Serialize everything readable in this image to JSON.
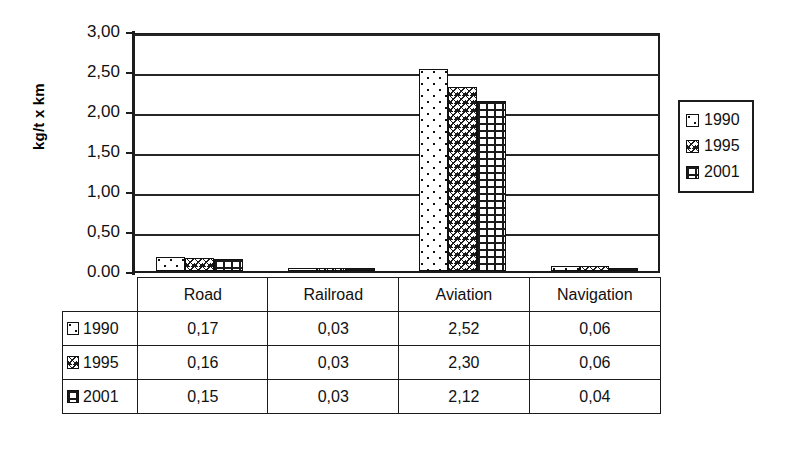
{
  "chart_data": {
    "type": "bar",
    "title": "",
    "subtitle": "",
    "xlabel": "",
    "ylabel": "kg/t x km",
    "categories": [
      "Road",
      "Railroad",
      "Aviation",
      "Navigation"
    ],
    "series": [
      {
        "name": "1990",
        "values": [
          0.17,
          0.03,
          2.52,
          0.06
        ],
        "pattern": "dots"
      },
      {
        "name": "1995",
        "values": [
          0.16,
          0.03,
          2.3,
          0.06
        ],
        "pattern": "zigzag"
      },
      {
        "name": "2001",
        "values": [
          0.15,
          0.03,
          2.12,
          0.04
        ],
        "pattern": "brick"
      }
    ],
    "ylim": [
      0,
      3.0
    ],
    "ytick_values": [
      3.0,
      2.5,
      2.0,
      1.5,
      1.0,
      0.5,
      0.0
    ],
    "ytick_labels": [
      "3,00",
      "2,50",
      "2,00",
      "1,50",
      "1,00",
      "0,50",
      "0,00"
    ],
    "grid": true,
    "legend_position": "right"
  },
  "legend": {
    "entries": [
      {
        "label": "1990",
        "swatch": "pattern-dots-swatch"
      },
      {
        "label": "1995",
        "swatch": "pattern-zigzag-swatch"
      },
      {
        "label": "2001",
        "swatch": "pattern-brick-swatch"
      }
    ]
  },
  "data_table": {
    "column_headers": [
      "Road",
      "Railroad",
      "Aviation",
      "Navigation"
    ],
    "rows": [
      {
        "label": "1990",
        "cells": [
          "0,17",
          "0,03",
          "2,52",
          "0,06"
        ]
      },
      {
        "label": "1995",
        "cells": [
          "0,16",
          "0,03",
          "2,30",
          "0,06"
        ]
      },
      {
        "label": "2001",
        "cells": [
          "0,15",
          "0,03",
          "2,12",
          "0,04"
        ]
      }
    ]
  },
  "colors": {
    "axis": "#1c1c1c",
    "grid": "#262626",
    "text": "#111111",
    "background": "#ffffff"
  }
}
